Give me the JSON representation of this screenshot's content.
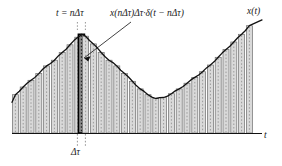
{
  "figure": {
    "labels": {
      "peak_sample": "t = nΔτ",
      "impulse_formula": "x(nΔτ)Δτ·δ(t − nΔτ)",
      "signal": "x(t)",
      "time_axis": "t",
      "interval": "Δτ"
    },
    "colors": {
      "curve": "#111111",
      "axis": "#111111",
      "bar_fill": "#d9d9d9",
      "bar_edge": "#6e6e6e",
      "bar_dotted_center": "#8a8a8a",
      "highlight_bar_fill": "#8c8c8c",
      "highlight_bar_edge": "#000000",
      "leader_line": "#111111",
      "background": "#ffffff"
    }
  },
  "chart_data": {
    "type": "area",
    "xlabel": "t",
    "ylabel": "x(t)",
    "grid": false,
    "legend": null,
    "axis": {
      "baseline_y": 133,
      "x_start": 12,
      "x_end": 262,
      "y_top": 18
    },
    "sampling": {
      "delta_tau_px": 7.8,
      "bar_width_px": 6.0,
      "highlight_index": 9,
      "highlight_center_x": 81.4,
      "n_samples": 32
    },
    "curve_note": "x(t) rises from left, peaks near t=nΔτ (x≈82px), falls to a minimum near x≈155px, then rises steadily to the right edge",
    "x": [
      15.4,
      23.2,
      31.0,
      38.8,
      46.6,
      54.4,
      62.2,
      70.0,
      77.8,
      81.4,
      85.6,
      93.4,
      101.2,
      109.0,
      116.8,
      124.6,
      132.4,
      140.2,
      148.0,
      155.8,
      163.6,
      171.4,
      179.2,
      187.0,
      194.8,
      202.6,
      210.4,
      218.2,
      226.0,
      233.8,
      241.6,
      249.4
    ],
    "values": [
      40,
      48,
      55,
      62,
      70,
      76,
      84,
      92,
      100,
      103,
      101,
      93,
      84,
      76,
      70,
      62,
      54,
      46,
      40,
      36,
      37,
      41,
      46,
      52,
      58,
      64,
      71,
      79,
      87,
      95,
      103,
      112
    ],
    "ylim": [
      0,
      120
    ],
    "annotations": [
      {
        "text": "t = nΔτ",
        "kind": "peak-sample-label",
        "anchor_x": 81,
        "anchor_y": 34
      },
      {
        "text": "x(nΔτ)Δτ·δ(t − nΔτ)",
        "kind": "impulse-formula-label",
        "anchor_x": 86,
        "anchor_y": 58
      },
      {
        "text": "x(t)",
        "kind": "signal-label",
        "anchor_x": 252,
        "anchor_y": 18
      },
      {
        "text": "t",
        "kind": "axis-label",
        "anchor_x": 266,
        "anchor_y": 133
      },
      {
        "text": "Δτ",
        "kind": "interval-label",
        "anchor_x": 81,
        "anchor_y": 150
      }
    ]
  }
}
